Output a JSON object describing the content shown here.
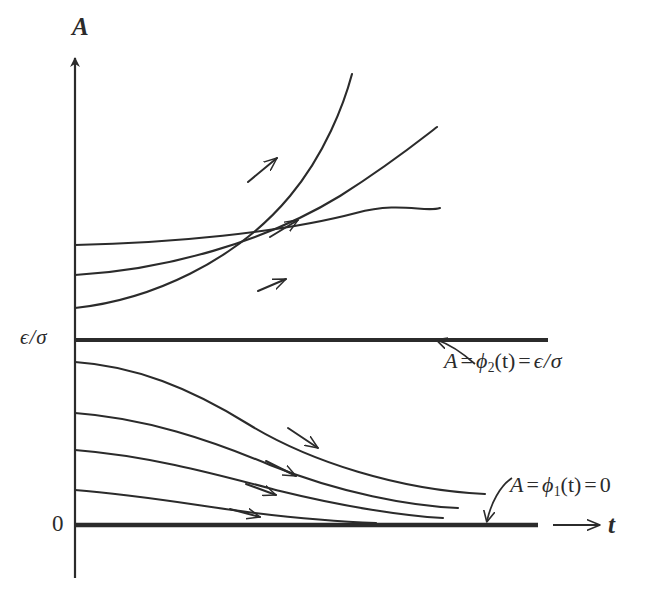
{
  "figure": {
    "type": "phase-portrait",
    "background_color": "#ffffff",
    "line_color": "#2b2b2b",
    "width": 657,
    "height": 606
  },
  "axes": {
    "y_axis_label": "A",
    "x_axis_label": "t",
    "y_ticks": [
      {
        "id": "eps-over-sigma",
        "label_epsilon": "ϵ",
        "label_slash": "/",
        "label_sigma": "σ",
        "value_text": "ϵ/σ",
        "pixel_y": 340
      },
      {
        "id": "zero",
        "value_text": "0",
        "pixel_y": 525
      }
    ],
    "x_axis_arrow": {
      "from_x": 553,
      "to_x": 602,
      "y": 525
    },
    "y_axis_arrow": {
      "x": 75,
      "from_y": 578,
      "to_y": 52
    }
  },
  "equilibria": [
    {
      "id": "phi2",
      "name": "upper-equilibrium",
      "label_parts": {
        "lhs": "A",
        "eq1": "=",
        "phi": "ϕ",
        "sub": "2",
        "arg": "(t)",
        "eq2": "=",
        "rhs_num": "ϵ",
        "rhs_slash": "/",
        "rhs_den": "σ"
      },
      "label_text": "A = ϕ₂(t) = ϵ/σ",
      "line": {
        "x1": 75,
        "x2": 548,
        "y": 340
      },
      "stability": "unstable"
    },
    {
      "id": "phi1",
      "name": "lower-equilibrium",
      "label_parts": {
        "lhs": "A",
        "eq1": "=",
        "phi": "ϕ",
        "sub": "1",
        "arg": "(t)",
        "eq2": "=",
        "rhs_num": "0"
      },
      "label_text": "A = ϕ₁(t) = 0",
      "line": {
        "x1": 75,
        "x2": 538,
        "y": 525
      },
      "stability": "stable"
    }
  ],
  "chart_data": {
    "type": "line",
    "title": "",
    "xlabel": "t",
    "ylabel": "A",
    "grid": false,
    "legend": "none",
    "y_tick_labels": [
      "0",
      "ϵ/σ"
    ],
    "y_tick_pixels": [
      525,
      340
    ],
    "annotations": [
      "A = ϕ₂(t) = ϵ/σ",
      "A = ϕ₁(t) = 0"
    ],
    "series": [
      {
        "name": "upper-trajectory-1",
        "region": "above-equilibrium",
        "direction": "increasing",
        "path": "M75,308 C150,300 235,262 290,196 C325,154 344,104 352,74",
        "arrow_at": {
          "x": 266,
          "y": 167,
          "angle_deg": -41
        }
      },
      {
        "name": "upper-trajectory-2",
        "region": "above-equilibrium",
        "direction": "increasing",
        "path": "M75,275 C165,270 265,242 340,196 C392,163 420,140 437,127",
        "arrow_at": {
          "x": 285,
          "y": 228,
          "angle_deg": -31
        }
      },
      {
        "name": "upper-trajectory-3",
        "region": "above-equilibrium",
        "direction": "increasing",
        "path": "M75,245 C170,243 280,233 356,213 C400,201 425,213 440,208",
        "arrow_at": {
          "x": 272,
          "y": 285,
          "angle_deg": -21
        }
      },
      {
        "name": "lower-trajectory-1",
        "region": "below-equilibrium",
        "direction": "decreasing-to-zero",
        "path": "M75,362 C135,366 190,388 248,424 C310,462 400,490 485,494",
        "arrow_at": {
          "x": 310,
          "y": 442,
          "angle_deg": 26
        }
      },
      {
        "name": "lower-trajectory-2",
        "region": "below-equilibrium",
        "direction": "decreasing-to-zero",
        "path": "M75,413 C145,418 210,440 270,465 C340,493 410,506 458,508",
        "arrow_at": {
          "x": 288,
          "y": 471,
          "angle_deg": 20
        }
      },
      {
        "name": "lower-trajectory-3",
        "region": "below-equilibrium",
        "direction": "decreasing-to-zero",
        "path": "M75,450 C150,456 215,474 280,491 C345,507 405,516 443,518",
        "arrow_at": {
          "x": 268,
          "y": 492,
          "angle_deg": 14
        }
      },
      {
        "name": "lower-trajectory-4",
        "region": "below-equilibrium",
        "direction": "decreasing-to-zero",
        "path": "M75,490 C140,495 200,506 255,513 C305,519 348,522 376,523",
        "arrow_at": {
          "x": 252,
          "y": 515,
          "angle_deg": 8
        }
      }
    ]
  }
}
